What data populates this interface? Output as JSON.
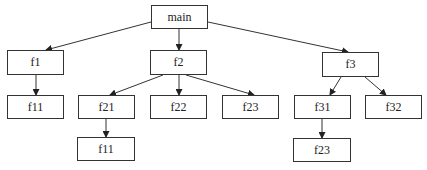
{
  "diagram": {
    "type": "call-tree",
    "nodes": [
      {
        "id": "main",
        "label": "main",
        "x": 151,
        "y": 5,
        "w": 57,
        "h": 24
      },
      {
        "id": "f1",
        "label": "f1",
        "x": 7,
        "y": 50,
        "w": 57,
        "h": 25
      },
      {
        "id": "f2",
        "label": "f2",
        "x": 150,
        "y": 50,
        "w": 57,
        "h": 25
      },
      {
        "id": "f3",
        "label": "f3",
        "x": 322,
        "y": 52,
        "w": 57,
        "h": 25
      },
      {
        "id": "f11a",
        "label": "f11",
        "x": 7,
        "y": 95,
        "w": 57,
        "h": 24
      },
      {
        "id": "f21",
        "label": "f21",
        "x": 78,
        "y": 95,
        "w": 57,
        "h": 24
      },
      {
        "id": "f22",
        "label": "f22",
        "x": 150,
        "y": 95,
        "w": 57,
        "h": 24
      },
      {
        "id": "f23a",
        "label": "f23",
        "x": 222,
        "y": 95,
        "w": 57,
        "h": 24
      },
      {
        "id": "f31",
        "label": "f31",
        "x": 294,
        "y": 95,
        "w": 57,
        "h": 24
      },
      {
        "id": "f32",
        "label": "f32",
        "x": 365,
        "y": 95,
        "w": 57,
        "h": 24
      },
      {
        "id": "f11b",
        "label": "f11",
        "x": 77,
        "y": 137,
        "w": 58,
        "h": 24
      },
      {
        "id": "f23b",
        "label": "f23",
        "x": 293,
        "y": 138,
        "w": 58,
        "h": 24
      }
    ],
    "edges": [
      {
        "from": "main",
        "to": "f1",
        "x1": 151,
        "y1": 22,
        "x2": 46,
        "y2": 50
      },
      {
        "from": "main",
        "to": "f2",
        "x1": 179,
        "y1": 29,
        "x2": 179,
        "y2": 50
      },
      {
        "from": "main",
        "to": "f3",
        "x1": 208,
        "y1": 22,
        "x2": 348,
        "y2": 52
      },
      {
        "from": "f1",
        "to": "f11a",
        "x1": 36,
        "y1": 75,
        "x2": 36,
        "y2": 95
      },
      {
        "from": "f2",
        "to": "f21",
        "x1": 163,
        "y1": 75,
        "x2": 110,
        "y2": 95
      },
      {
        "from": "f2",
        "to": "f22",
        "x1": 179,
        "y1": 75,
        "x2": 179,
        "y2": 95
      },
      {
        "from": "f2",
        "to": "f23a",
        "x1": 186,
        "y1": 75,
        "x2": 254,
        "y2": 95
      },
      {
        "from": "f3",
        "to": "f31",
        "x1": 341,
        "y1": 77,
        "x2": 330,
        "y2": 95
      },
      {
        "from": "f3",
        "to": "f32",
        "x1": 365,
        "y1": 77,
        "x2": 386,
        "y2": 95
      },
      {
        "from": "f21",
        "to": "f11b",
        "x1": 106,
        "y1": 119,
        "x2": 106,
        "y2": 137
      },
      {
        "from": "f31",
        "to": "f23b",
        "x1": 322,
        "y1": 119,
        "x2": 322,
        "y2": 138
      }
    ],
    "colors": {
      "stroke": "#333333",
      "fill": "#ffffff",
      "text": "#222222"
    }
  }
}
